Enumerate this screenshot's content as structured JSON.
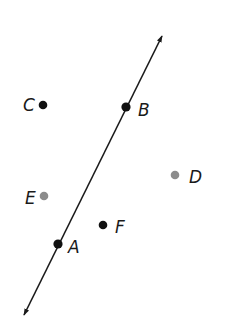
{
  "diagram": {
    "type": "geometry-points-and-line",
    "line": {
      "name": "line AB",
      "through": [
        "A",
        "B"
      ],
      "arrows": "both-ends",
      "color": "#1a1a1a"
    },
    "points": [
      {
        "id": "A",
        "label": "A",
        "on_line": true,
        "color": "#111111"
      },
      {
        "id": "B",
        "label": "B",
        "on_line": true,
        "color": "#111111"
      },
      {
        "id": "C",
        "label": "C",
        "on_line": false,
        "color": "#111111"
      },
      {
        "id": "D",
        "label": "D",
        "on_line": false,
        "color": "#8c8c8c"
      },
      {
        "id": "E",
        "label": "E",
        "on_line": false,
        "color": "#8c8c8c"
      },
      {
        "id": "F",
        "label": "F",
        "on_line": false,
        "color": "#111111"
      }
    ]
  }
}
